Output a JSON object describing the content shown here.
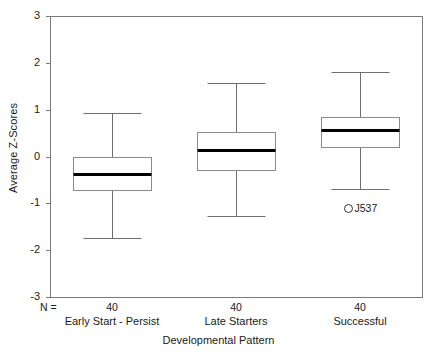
{
  "chart_data": {
    "type": "box",
    "title": "",
    "xlabel": "Developmental Pattern",
    "ylabel": "Average Z-Scores",
    "ylim": [
      -3,
      3
    ],
    "yticks": [
      3,
      2,
      1,
      0,
      -1,
      -2,
      -3
    ],
    "ytick_labels": [
      "3",
      "2",
      "1",
      "0",
      "-1",
      "-2",
      "-3"
    ],
    "grid": false,
    "legend": null,
    "n_prefix": "N =",
    "categories": [
      "Early Start - Persist",
      "Late Starters",
      "Successful"
    ],
    "counts": [
      "40",
      "40",
      "40"
    ],
    "boxes": [
      {
        "category": "Early Start - Persist",
        "n": "40",
        "whisker_low": -1.75,
        "q1": -0.71,
        "median": -0.37,
        "q3": 0.0,
        "whisker_high": 0.92,
        "outliers": []
      },
      {
        "category": "Late Starters",
        "n": "40",
        "whisker_low": -1.28,
        "q1": -0.28,
        "median": 0.14,
        "q3": 0.52,
        "whisker_high": 1.56,
        "outliers": []
      },
      {
        "category": "Successful",
        "n": "40",
        "whisker_low": -0.7,
        "q1": 0.2,
        "median": 0.56,
        "q3": 0.85,
        "whisker_high": 1.8,
        "outliers": [
          {
            "value": -1.1,
            "label": "J537",
            "marker": "open-circle"
          }
        ]
      }
    ],
    "colors": {
      "frame": "#7a7a7a",
      "box_edge": "#8a8a8a",
      "median": "#000000",
      "whisker": "#6e6e6e",
      "outlier": "#333333",
      "background": "#ffffff",
      "text": "#1a1a1a"
    }
  }
}
